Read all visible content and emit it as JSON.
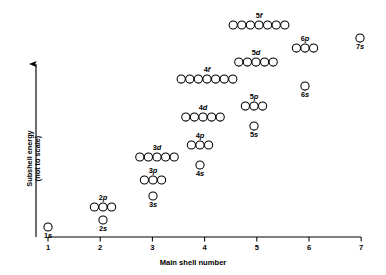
{
  "chart_data": {
    "type": "scatter",
    "title": "",
    "xlabel": "Main shell number",
    "ylabel": "Subshell energy (not to scale)",
    "ylabel_line1": "Subshell energy",
    "ylabel_line2": "(not to scale)",
    "xticks": [
      "1",
      "2",
      "3",
      "4",
      "5",
      "6",
      "7"
    ],
    "xlim": [
      1,
      7
    ],
    "grid": false,
    "legend": "none",
    "y_axis_note": "energy increases upward, arrow-headed axis, no numeric scale",
    "points": [
      {
        "label": "1s",
        "shell": 1,
        "subshell": "s",
        "boxes": 1,
        "energy_rank": 1
      },
      {
        "label": "2s",
        "shell": 2,
        "subshell": "s",
        "boxes": 1,
        "energy_rank": 2
      },
      {
        "label": "2p",
        "shell": 2,
        "subshell": "p",
        "boxes": 3,
        "energy_rank": 3
      },
      {
        "label": "3s",
        "shell": 3,
        "subshell": "s",
        "boxes": 1,
        "energy_rank": 4
      },
      {
        "label": "3p",
        "shell": 3,
        "subshell": "p",
        "boxes": 3,
        "energy_rank": 5
      },
      {
        "label": "4s",
        "shell": 4,
        "subshell": "s",
        "boxes": 1,
        "energy_rank": 6
      },
      {
        "label": "3d",
        "shell": 3,
        "subshell": "d",
        "boxes": 5,
        "energy_rank": 7
      },
      {
        "label": "4p",
        "shell": 4,
        "subshell": "p",
        "boxes": 3,
        "energy_rank": 8
      },
      {
        "label": "5s",
        "shell": 5,
        "subshell": "s",
        "boxes": 1,
        "energy_rank": 9
      },
      {
        "label": "4d",
        "shell": 4,
        "subshell": "d",
        "boxes": 5,
        "energy_rank": 10
      },
      {
        "label": "5p",
        "shell": 5,
        "subshell": "p",
        "boxes": 3,
        "energy_rank": 11
      },
      {
        "label": "6s",
        "shell": 6,
        "subshell": "s",
        "boxes": 1,
        "energy_rank": 12
      },
      {
        "label": "4f",
        "shell": 4,
        "subshell": "f",
        "boxes": 7,
        "energy_rank": 13
      },
      {
        "label": "5d",
        "shell": 5,
        "subshell": "d",
        "boxes": 5,
        "energy_rank": 14
      },
      {
        "label": "6p",
        "shell": 6,
        "subshell": "p",
        "boxes": 3,
        "energy_rank": 15
      },
      {
        "label": "7s",
        "shell": 7,
        "subshell": "s",
        "boxes": 1,
        "energy_rank": 16
      },
      {
        "label": "5f",
        "shell": 5,
        "subshell": "f",
        "boxes": 7,
        "energy_rank": 17
      }
    ]
  },
  "geometry": {
    "circle_radius": 4.1,
    "circle_spacing": 8.6,
    "axis_y": 237,
    "axis_x_left": 48,
    "axis_x_right": 361,
    "tick_spacing": 52.2,
    "yaxis_x": 36,
    "yaxis_top": 64,
    "label_offset": 7.5,
    "placements": [
      {
        "label": "1s",
        "cx": 48,
        "cy": 227
      },
      {
        "label": "2s",
        "cx": 103,
        "cy": 220
      },
      {
        "label": "2p",
        "cx": 103,
        "cy": 207
      },
      {
        "label": "3s",
        "cx": 153,
        "cy": 196
      },
      {
        "label": "3p",
        "cx": 153,
        "cy": 180
      },
      {
        "label": "3d",
        "cx": 157,
        "cy": 157
      },
      {
        "label": "4s",
        "cx": 200,
        "cy": 165
      },
      {
        "label": "4p",
        "cx": 200,
        "cy": 145
      },
      {
        "label": "4d",
        "cx": 203,
        "cy": 117
      },
      {
        "label": "4f",
        "cx": 207,
        "cy": 79
      },
      {
        "label": "5s",
        "cx": 254,
        "cy": 126
      },
      {
        "label": "5p",
        "cx": 254,
        "cy": 106
      },
      {
        "label": "5d",
        "cx": 256,
        "cy": 62
      },
      {
        "label": "5f",
        "cx": 259,
        "cy": 25
      },
      {
        "label": "6s",
        "cx": 305,
        "cy": 86
      },
      {
        "label": "6p",
        "cx": 305,
        "cy": 48
      },
      {
        "label": "7s",
        "cx": 360,
        "cy": 38
      }
    ]
  },
  "colors": {
    "ink": "#000000",
    "background": "#ffffff",
    "circle_fill": "#ffffff"
  }
}
